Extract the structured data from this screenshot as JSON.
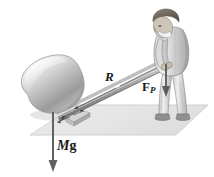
{
  "figure": {
    "background_color": "#ffffff",
    "ground": {
      "name": "ground-plane",
      "color": "#e8e8e8",
      "edge_color": "#cfcfcf"
    },
    "colors": {
      "rock_light": "#f2f2f2",
      "rock_mid": "#b9b9b9",
      "rock_dark": "#8a8a8a",
      "bar": "#9a9a9a",
      "bar_dark": "#6e6e6e",
      "clothing_light": "#e2e2e2",
      "clothing_mid": "#b5b5b5",
      "clothing_dark": "#7d7d7d",
      "hair": "#6b6257",
      "skin": "#cfc4b8",
      "shoe": "#8c8c8c",
      "arrow": "#5a5a5a",
      "ink": "#1a1a1a"
    },
    "objects": [
      {
        "name": "boulder",
        "description": "large grey shaded rock resting on the ground"
      },
      {
        "name": "lever-bar",
        "description": "long straight bar from under the rock up to the man's hands"
      },
      {
        "name": "fulcrum-block",
        "description": "small wedge block under the bar near the rock"
      },
      {
        "name": "person",
        "description": "man in suit bending forward pushing down on the lever end"
      }
    ],
    "labels": {
      "lever_arm": "R",
      "force_applied": "F",
      "force_applied_sub": "P",
      "weight_m": "M",
      "weight_g": "g",
      "fulcrum_arm": "r"
    },
    "vectors": [
      {
        "name": "applied-force-arrow",
        "label": "F_P",
        "direction": "down",
        "at": "man's hands on bar end"
      },
      {
        "name": "weight-arrow",
        "label": "Mg",
        "direction": "down",
        "at": "below the boulder"
      },
      {
        "name": "lever-arm-indicator",
        "label": "R",
        "direction": "along bar",
        "at": "mid bar"
      },
      {
        "name": "fulcrum-arm-indicator",
        "label": "r",
        "direction": "along bar",
        "at": "fulcrum to rock contact"
      }
    ]
  }
}
